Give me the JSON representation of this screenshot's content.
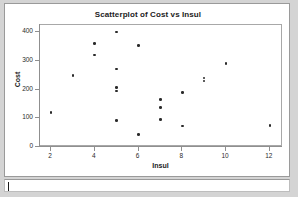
{
  "window": {
    "caret_present": true
  },
  "chart_data": {
    "type": "scatter",
    "title": "Scatterplot of Cost vs Insul",
    "xlabel": "Insul",
    "ylabel": "Cost",
    "xlim": [
      1.5,
      12.6
    ],
    "ylim": [
      0,
      425
    ],
    "xticks": [
      2,
      4,
      6,
      8,
      10,
      12
    ],
    "yticks": [
      0,
      100,
      200,
      300,
      400
    ],
    "grid": false,
    "legend": null,
    "marker": "filled-circle",
    "marker_color": "#2a2a2a",
    "points": [
      {
        "x": 2,
        "y": 120
      },
      {
        "x": 3,
        "y": 250
      },
      {
        "x": 4,
        "y": 360
      },
      {
        "x": 4,
        "y": 320
      },
      {
        "x": 5,
        "y": 400
      },
      {
        "x": 5,
        "y": 272
      },
      {
        "x": 5,
        "y": 207
      },
      {
        "x": 5,
        "y": 195
      },
      {
        "x": 5,
        "y": 92
      },
      {
        "x": 6,
        "y": 353
      },
      {
        "x": 6,
        "y": 43
      },
      {
        "x": 7,
        "y": 165
      },
      {
        "x": 7,
        "y": 138
      },
      {
        "x": 7,
        "y": 95
      },
      {
        "x": 8,
        "y": 190
      },
      {
        "x": 8,
        "y": 73
      },
      {
        "x": 9,
        "y": 240
      },
      {
        "x": 9,
        "y": 230
      },
      {
        "x": 10,
        "y": 290
      },
      {
        "x": 12,
        "y": 75
      }
    ]
  }
}
